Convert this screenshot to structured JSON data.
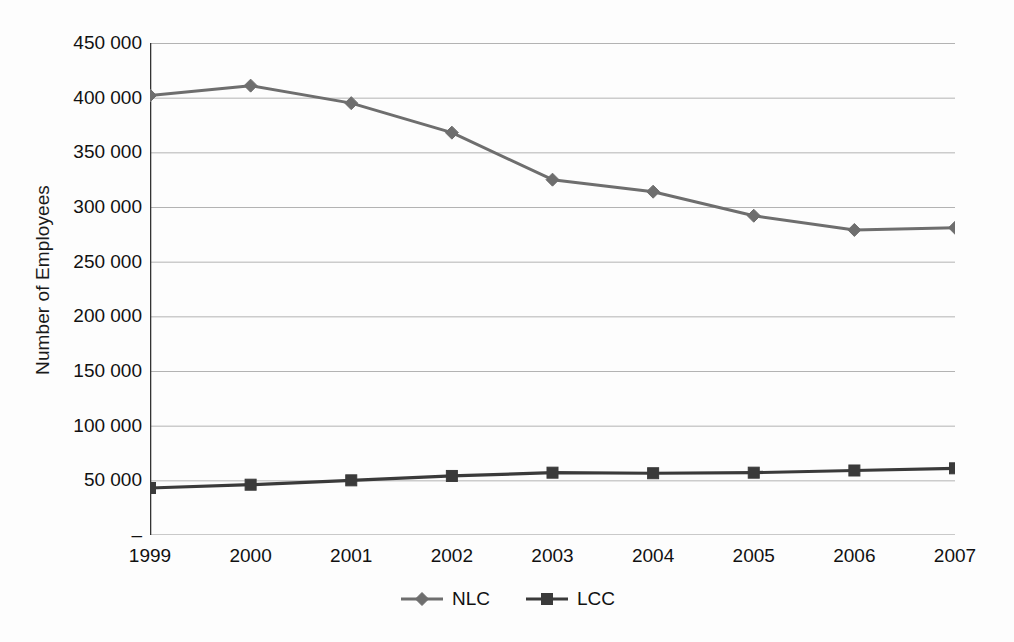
{
  "chart_data": {
    "type": "line",
    "title": "",
    "xlabel": "",
    "ylabel": "Number of Employees",
    "categories": [
      "1999",
      "2000",
      "2001",
      "2002",
      "2003",
      "2004",
      "2005",
      "2006",
      "2007"
    ],
    "x": [
      1999,
      2000,
      2001,
      2002,
      2003,
      2004,
      2005,
      2006,
      2007
    ],
    "series": [
      {
        "name": "NLC",
        "marker": "diamond",
        "color": "#6e6e6e",
        "values": [
          402000,
          411000,
          395000,
          368000,
          325000,
          314000,
          292000,
          279000,
          281000
        ]
      },
      {
        "name": "LCC",
        "marker": "square",
        "color": "#3a3a3a",
        "values": [
          43000,
          46000,
          50000,
          54000,
          57000,
          56500,
          57000,
          59000,
          61000
        ]
      }
    ],
    "ylim": [
      0,
      450000
    ],
    "y_ticks": [
      0,
      50000,
      100000,
      150000,
      200000,
      250000,
      300000,
      350000,
      400000,
      450000
    ],
    "y_tick_labels": [
      "–",
      "50 000",
      "100 000",
      "150 000",
      "200 000",
      "250 000",
      "300 000",
      "350 000",
      "400 000",
      "450 000"
    ],
    "grid": true,
    "grid_color": "#b3b3b3",
    "axis_color": "#333333",
    "legend_position": "bottom",
    "background": "#fdfdfd"
  },
  "legend": {
    "items": [
      {
        "label": "NLC",
        "marker": "diamond-marker",
        "color": "#6e6e6e"
      },
      {
        "label": "LCC",
        "marker": "square-marker",
        "color": "#3a3a3a"
      }
    ]
  }
}
